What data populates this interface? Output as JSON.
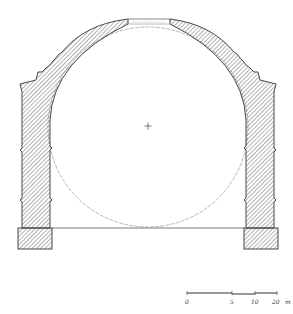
{
  "drawing": {
    "type": "architectural cross-section",
    "subject": "domed rotunda section with inscribed circle",
    "center_marker": "+",
    "stroke_color": "#333333",
    "hatch_color": "#555555",
    "guide_circle_color": "#888888"
  },
  "scale_bar": {
    "labels": [
      "0",
      "5",
      "10",
      "20"
    ],
    "unit": "m",
    "last_label": "20 m"
  }
}
